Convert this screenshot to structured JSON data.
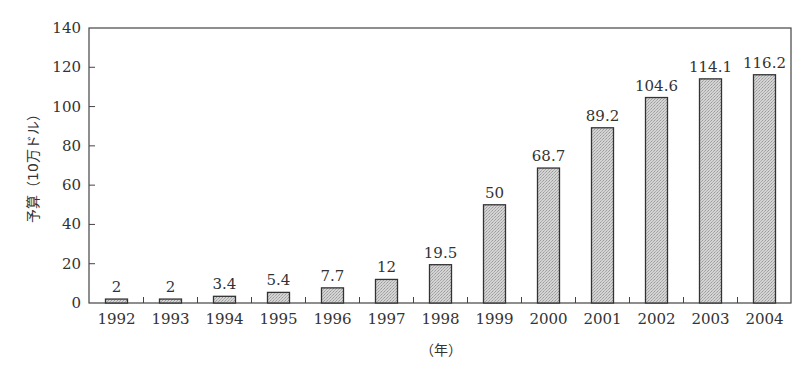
{
  "chart_data": {
    "type": "bar",
    "title": "",
    "xlabel": "（年）",
    "ylabel": "予算（10万ドル）",
    "categories": [
      "1992",
      "1993",
      "1994",
      "1995",
      "1996",
      "1997",
      "1998",
      "1999",
      "2000",
      "2001",
      "2002",
      "2003",
      "2004"
    ],
    "values": [
      2,
      2,
      3.4,
      5.4,
      7.7,
      12,
      19.5,
      50,
      68.7,
      89.2,
      104.6,
      114.1,
      116.2
    ],
    "value_labels": [
      "2",
      "2",
      "3.4",
      "5.4",
      "7.7",
      "12",
      "19.5",
      "50",
      "68.7",
      "89.2",
      "104.6",
      "114.1",
      "116.2"
    ],
    "ylim": [
      0,
      140
    ],
    "yticks": [
      0,
      20,
      40,
      60,
      80,
      100,
      120,
      140
    ],
    "grid": false,
    "legend": null,
    "bar_color": "#c8c8c8",
    "bar_edge_color": "#333333"
  }
}
